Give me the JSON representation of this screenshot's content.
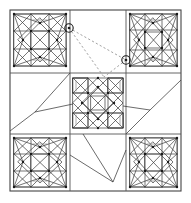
{
  "figure": {
    "type": "diagram",
    "width": 191,
    "height": 203,
    "background_color": "#ffffff"
  },
  "colors": {
    "frame": "#444444",
    "grid": "#555555",
    "block_line": "#3a3a3a",
    "grey_line": "#9a9a9a",
    "dashed_connector": "#8a8a8a",
    "node": "#1a1a1a",
    "marker": "#1a1a1a"
  },
  "layout": {
    "frame": {
      "x": 10,
      "y": 10,
      "width": 171,
      "height": 181
    },
    "vertical_grid_x": [
      70,
      126
    ],
    "horizontal_grid_y": [
      73,
      134
    ],
    "columns": 3,
    "rows": 3
  },
  "blocks": [
    {
      "id": "top-left",
      "name": "star-block-top-left",
      "x": 10,
      "y": 10,
      "size": 60,
      "style": "star-in-square"
    },
    {
      "id": "top-right",
      "name": "star-block-top-right",
      "x": 126,
      "y": 10,
      "size": 55,
      "style": "star-in-square"
    },
    {
      "id": "center",
      "name": "star-block-center",
      "x": 73,
      "y": 78,
      "size": 50,
      "style": "pinwheel-star"
    },
    {
      "id": "bottom-left",
      "name": "star-block-bottom-left",
      "x": 10,
      "y": 134,
      "size": 57,
      "style": "star-in-square"
    },
    {
      "id": "bottom-right",
      "name": "star-block-bottom-right",
      "x": 126,
      "y": 134,
      "size": 55,
      "style": "star-in-square"
    }
  ],
  "panels": [
    {
      "id": "top-center",
      "name": "panel-top-center",
      "content": "empty"
    },
    {
      "id": "middle-left",
      "name": "panel-middle-left",
      "content": "connector-lines"
    },
    {
      "id": "middle-right",
      "name": "panel-middle-right",
      "content": "connector-lines"
    },
    {
      "id": "bottom-center",
      "name": "panel-bottom-center",
      "content": "connector-lines"
    }
  ],
  "markers": [
    {
      "id": "marker-a",
      "name": "circled-node-a",
      "cx": 69,
      "cy": 28,
      "r": 4.2,
      "label": ""
    },
    {
      "id": "marker-b",
      "name": "circled-node-b",
      "cx": 126,
      "cy": 60,
      "r": 4.2,
      "label": ""
    }
  ],
  "dashed_connectors": [
    {
      "from": "marker-a",
      "to": "marker-b",
      "path": "M 69 28 L 126 60"
    },
    {
      "from": "marker-a",
      "to": "fan-point",
      "path": "M 69 28 L 104 77"
    },
    {
      "from": "marker-b",
      "to": "fan-point",
      "path": "M 126 60 L 104 77"
    }
  ],
  "connector_lines": [
    {
      "name": "connector-middle-left-upper",
      "path": "M 70 73 L 35 112"
    },
    {
      "name": "connector-middle-left-lower",
      "path": "M 10 131 L 35 112"
    },
    {
      "name": "connector-middle-left-diag",
      "path": "M 73 104 L 35 112"
    },
    {
      "name": "connector-middle-right-up",
      "path": "M 181 80 L 150 110"
    },
    {
      "name": "connector-middle-right-down",
      "path": "M 126 134 L 150 110"
    },
    {
      "name": "connector-middle-right-in",
      "path": "M 123 106 L 150 110"
    },
    {
      "name": "connector-bottom-center-a",
      "path": "M 83 134 L 113 182"
    },
    {
      "name": "connector-bottom-center-b",
      "path": "M 70 155 L 113 182"
    },
    {
      "name": "connector-bottom-center-c",
      "path": "M 113 182 L 126 150"
    }
  ]
}
